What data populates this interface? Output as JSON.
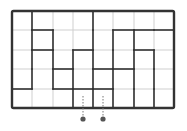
{
  "puzzle": {
    "cols": 8,
    "rows": 5,
    "col_x": [
      12,
      32,
      53,
      73,
      93,
      113,
      134,
      154,
      174
    ],
    "row_y": [
      11,
      30,
      50,
      69,
      89,
      108
    ],
    "colors": {
      "grid_line": "#cfcfcf",
      "wall": "#333333",
      "dot": "#555555",
      "dotted": "#777777",
      "background": "#ffffff"
    },
    "vertical_walls": [
      {
        "x": 1,
        "rows": [
          0,
          1,
          2,
          3
        ]
      },
      {
        "x": 2,
        "rows": [
          1,
          2,
          3
        ]
      },
      {
        "x": 3,
        "rows": [
          2,
          3,
          4
        ]
      },
      {
        "x": 4,
        "rows": [
          0,
          1,
          2,
          3,
          4
        ]
      },
      {
        "x": 5,
        "rows": [
          1,
          2,
          3,
          4
        ]
      },
      {
        "x": 6,
        "rows": [
          1,
          2,
          3,
          4
        ]
      },
      {
        "x": 7,
        "rows": [
          2,
          3,
          4
        ]
      }
    ],
    "horizontal_walls": [
      {
        "y": 1,
        "cols": [
          1,
          5,
          6,
          7
        ]
      },
      {
        "y": 2,
        "cols": [
          1,
          3,
          6
        ]
      },
      {
        "y": 3,
        "cols": [
          2,
          4,
          5
        ]
      },
      {
        "y": 4,
        "cols": [
          0,
          2,
          3,
          4
        ]
      }
    ],
    "exits": [
      {
        "x": 83,
        "line_top": 96,
        "dot_y": 119
      },
      {
        "x": 103,
        "line_top": 96,
        "dot_y": 119
      }
    ]
  }
}
